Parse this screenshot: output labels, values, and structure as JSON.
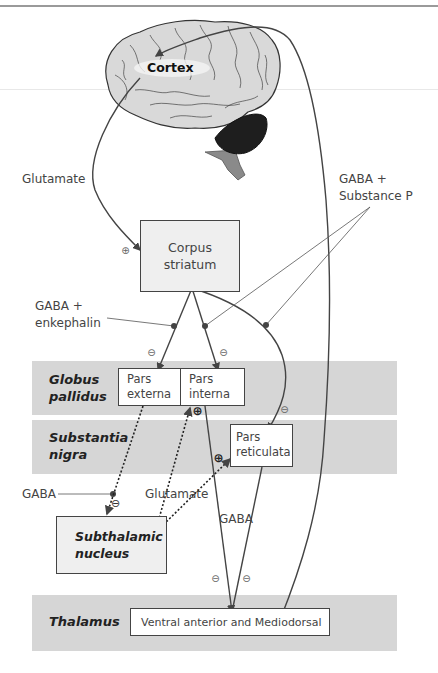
{
  "diagram": {
    "title_node": "Cortex",
    "nodes": {
      "corpus_striatum": {
        "line1": "Corpus",
        "line2": "striatum"
      },
      "pars_externa": {
        "line1": "Pars",
        "line2": "externa"
      },
      "pars_interna": {
        "line1": "Pars",
        "line2": "interna"
      },
      "pars_reticulata": {
        "line1": "Pars",
        "line2": "reticulata"
      },
      "subthalamic_nucleus": {
        "line1": "Subthalamic",
        "line2": "nucleus"
      },
      "thalamus_nucleus": "Ventral anterior and Mediodorsal"
    },
    "regions": {
      "globus_pallidus": {
        "line1": "Globus",
        "line2": "pallidus"
      },
      "substantia_nigra": {
        "line1": "Substantia",
        "line2": "nigra"
      },
      "thalamus": "Thalamus"
    },
    "labels": {
      "glutamate_cortex": "Glutamate",
      "gaba_substance_p": {
        "line1": "GABA +",
        "line2": "Substance P"
      },
      "gaba_enkephalin": {
        "line1": "GABA +",
        "line2": "enkephalin"
      },
      "gaba_stn": "GABA",
      "glutamate_stn": "Glutamate",
      "gaba_thalamus": "GABA"
    },
    "symbols": {
      "excitatory": "⊕",
      "inhibitory": "⊖"
    },
    "connections": [
      {
        "from": "Cortex",
        "to": "Corpus striatum",
        "transmitter": "Glutamate",
        "effect": "excitatory"
      },
      {
        "from": "Corpus striatum",
        "to": "Pars externa",
        "transmitter": "GABA + enkephalin",
        "effect": "inhibitory"
      },
      {
        "from": "Corpus striatum",
        "to": "Pars interna",
        "transmitter": "GABA + Substance P",
        "effect": "inhibitory"
      },
      {
        "from": "Corpus striatum",
        "to": "Pars reticulata",
        "transmitter": "GABA + Substance P",
        "effect": "inhibitory"
      },
      {
        "from": "Pars externa",
        "to": "Subthalamic nucleus",
        "transmitter": "GABA",
        "effect": "inhibitory"
      },
      {
        "from": "Subthalamic nucleus",
        "to": "Pars interna",
        "transmitter": "Glutamate",
        "effect": "excitatory"
      },
      {
        "from": "Subthalamic nucleus",
        "to": "Pars reticulata",
        "transmitter": "Glutamate",
        "effect": "excitatory"
      },
      {
        "from": "Pars interna",
        "to": "Ventral anterior and Mediodorsal",
        "transmitter": "GABA",
        "effect": "inhibitory"
      },
      {
        "from": "Pars reticulata",
        "to": "Ventral anterior and Mediodorsal",
        "transmitter": "GABA",
        "effect": "inhibitory"
      },
      {
        "from": "Ventral anterior and Mediodorsal",
        "to": "Cortex",
        "transmitter": "",
        "effect": ""
      }
    ],
    "colors": {
      "band": "#d6d6d6",
      "box_fill": "#ffffff",
      "box_gray": "#efefef",
      "line": "#444444",
      "brain": "#d9d9d9",
      "cerebellum": "#1e1e1e",
      "brainstem": "#8a8a8a"
    }
  }
}
